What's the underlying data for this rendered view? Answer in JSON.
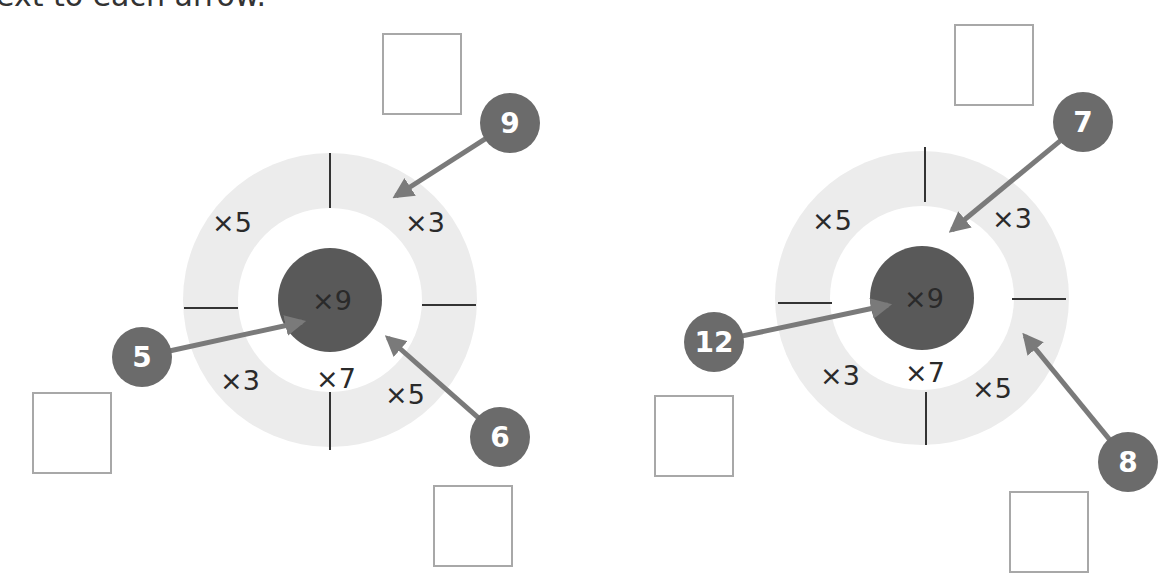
{
  "instruction": "ext to each arrow.",
  "colors": {
    "ring": "#ececec",
    "center": "#595959",
    "arrow": "#7a7a7a",
    "badge": "#6b6b6b",
    "divider": "#333333",
    "box_border": "#a8a8a8"
  },
  "targets": [
    {
      "name": "left-target",
      "center_label": "×9",
      "inner_label": "×7",
      "segments": [
        {
          "position": "top-left",
          "label": "×5"
        },
        {
          "position": "top-right",
          "label": "×3"
        },
        {
          "position": "bottom-left",
          "label": "×3"
        },
        {
          "position": "bottom-right",
          "label": "×5"
        }
      ],
      "arrows": [
        {
          "number": "9",
          "points_to": "×3 segment (top-right)"
        },
        {
          "number": "5",
          "points_to": "×9 center"
        },
        {
          "number": "6",
          "points_to": "×5 segment (bottom-right)"
        }
      ],
      "answer_boxes": [
        "",
        "",
        ""
      ]
    },
    {
      "name": "right-target",
      "center_label": "×9",
      "inner_label": "×7",
      "segments": [
        {
          "position": "top-left",
          "label": "×5"
        },
        {
          "position": "top-right",
          "label": "×3"
        },
        {
          "position": "bottom-left",
          "label": "×3"
        },
        {
          "position": "bottom-right",
          "label": "×5"
        }
      ],
      "arrows": [
        {
          "number": "7",
          "points_to": "×7 inner ring"
        },
        {
          "number": "12",
          "points_to": "×9 center"
        },
        {
          "number": "8",
          "points_to": "×5 segment (bottom-right)"
        }
      ],
      "answer_boxes": [
        "",
        "",
        ""
      ]
    }
  ]
}
